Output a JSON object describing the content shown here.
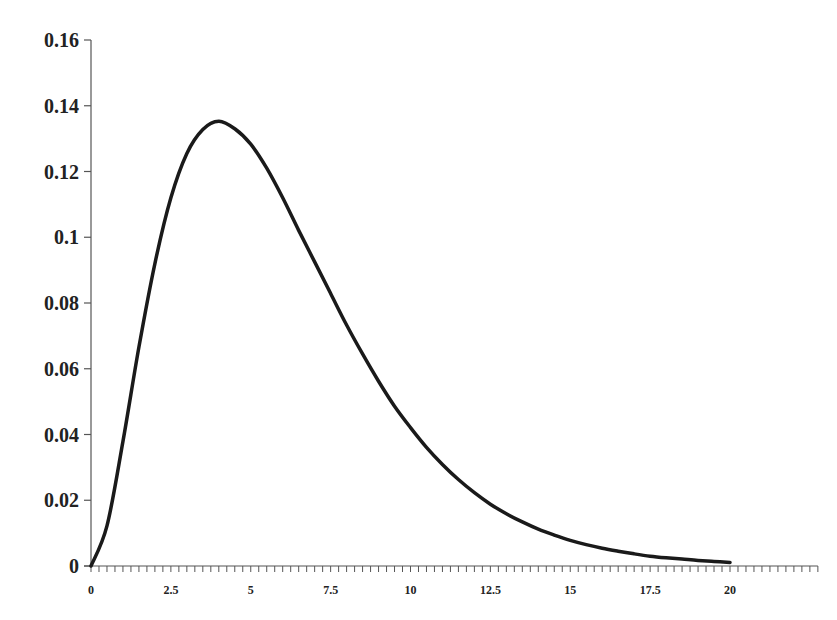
{
  "chart_data": {
    "type": "line",
    "title": "",
    "xlabel": "",
    "ylabel": "",
    "xlim": [
      0,
      22.75
    ],
    "ylim": [
      0,
      0.16
    ],
    "grid": false,
    "legend": null,
    "x_ticks": [
      "0",
      "2.5",
      "5",
      "7.5",
      "10",
      "12.5",
      "15",
      "17.5",
      "20"
    ],
    "x_tick_values": [
      0,
      2.5,
      5,
      7.5,
      10,
      12.5,
      15,
      17.5,
      20
    ],
    "x_minor_tick_step": 0.25,
    "y_ticks": [
      "0",
      "0.02",
      "0.04",
      "0.06",
      "0.08",
      "0.1",
      "0.12",
      "0.14",
      "0.16"
    ],
    "y_tick_values": [
      0,
      0.02,
      0.04,
      0.06,
      0.08,
      0.1,
      0.12,
      0.14,
      0.16
    ],
    "series": [
      {
        "name": "density",
        "color": "#1a1a1a",
        "x": [
          0,
          0.5,
          1,
          1.5,
          2,
          2.5,
          3,
          3.5,
          4,
          4.5,
          5,
          5.5,
          6,
          6.5,
          7,
          7.5,
          8,
          8.5,
          9,
          9.5,
          10,
          10.5,
          11,
          11.5,
          12,
          12.5,
          13,
          13.5,
          14,
          14.5,
          15,
          15.5,
          16,
          16.5,
          17,
          17.5,
          18,
          18.5,
          19,
          19.5,
          20
        ],
        "values": [
          0,
          0.0122,
          0.0379,
          0.0666,
          0.092,
          0.112,
          0.1255,
          0.1328,
          0.1353,
          0.133,
          0.1283,
          0.121,
          0.112,
          0.1021,
          0.0925,
          0.0829,
          0.0733,
          0.0645,
          0.0562,
          0.0486,
          0.0421,
          0.0361,
          0.0309,
          0.0263,
          0.0223,
          0.0188,
          0.0159,
          0.0134,
          0.0112,
          0.0094,
          0.0078,
          0.0065,
          0.0054,
          0.0045,
          0.0037,
          0.003,
          0.0025,
          0.0021,
          0.0017,
          0.0014,
          0.0011
        ]
      }
    ]
  }
}
